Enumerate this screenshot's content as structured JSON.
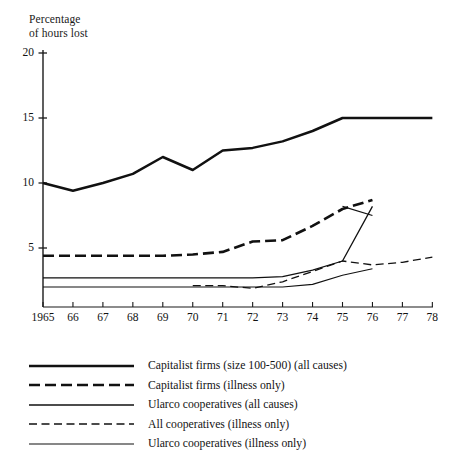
{
  "figure": {
    "axis_title": "Percentage\nof hours lost"
  },
  "axis": {
    "y_ticks": [
      "5",
      "10",
      "15",
      "20"
    ],
    "x_ticks": [
      "1965",
      "66",
      "67",
      "68",
      "69",
      "70",
      "71",
      "72",
      "73",
      "74",
      "75",
      "76",
      "77",
      "78"
    ]
  },
  "legend": {
    "items": [
      {
        "label": "Capitalist firms (size 100-500) (all causes)",
        "style": "solid-thick",
        "name": "legend-capitalist-all-causes"
      },
      {
        "label": "Capitalist firms (illness only)",
        "style": "dashed-thick",
        "name": "legend-capitalist-illness"
      },
      {
        "label": "Ularco cooperatives (all causes)",
        "style": "solid-thin",
        "name": "legend-ularco-all-causes"
      },
      {
        "label": "All cooperatives (illness only)",
        "style": "dashed-thin",
        "name": "legend-all-coops-illness"
      },
      {
        "label": "Ularco cooperatives (illness only)",
        "style": "solid-hairline",
        "name": "legend-ularco-illness"
      }
    ]
  },
  "chart_data": {
    "type": "line",
    "title": "",
    "xlabel": "",
    "ylabel": "Percentage of hours lost",
    "xlim": [
      1965,
      1978
    ],
    "ylim": [
      0,
      21
    ],
    "yticks": [
      5,
      10,
      15,
      20
    ],
    "xticks": [
      1965,
      1966,
      1967,
      1968,
      1969,
      1970,
      1971,
      1972,
      1973,
      1974,
      1975,
      1976,
      1977,
      1978
    ],
    "grid": false,
    "legend_position": "below",
    "series": [
      {
        "name": "Capitalist firms (size 100-500) (all causes)",
        "style": "solid-thick",
        "x": [
          1965,
          1966,
          1967,
          1968,
          1969,
          1970,
          1971,
          1972,
          1973,
          1974,
          1975,
          1976,
          1977,
          1978
        ],
        "values": [
          10.0,
          9.4,
          10.0,
          10.7,
          12.0,
          11.0,
          12.5,
          12.7,
          13.2,
          14.0,
          15.0,
          15.0,
          15.0,
          15.0
        ]
      },
      {
        "name": "Capitalist firms (illness only)",
        "style": "dashed-thick",
        "x": [
          1965,
          1966,
          1967,
          1968,
          1969,
          1970,
          1971,
          1972,
          1973,
          1974,
          1975,
          1976
        ],
        "values": [
          4.4,
          4.4,
          4.4,
          4.4,
          4.4,
          4.5,
          4.7,
          5.5,
          5.6,
          6.7,
          8.0,
          8.7
        ]
      },
      {
        "name": "Ularco cooperatives (all causes)",
        "style": "solid-thin",
        "x": [
          1965,
          1966,
          1967,
          1968,
          1969,
          1970,
          1971,
          1972,
          1973,
          1974,
          1975,
          1976
        ],
        "values": [
          2.7,
          2.7,
          2.7,
          2.7,
          2.7,
          2.7,
          2.7,
          2.7,
          2.8,
          3.3,
          4.0,
          8.2
        ]
      },
      {
        "name": "All cooperatives (illness only)",
        "style": "dashed-thin",
        "x": [
          1970,
          1971,
          1972,
          1973,
          1974,
          1975,
          1976,
          1977,
          1978
        ],
        "values": [
          2.1,
          2.1,
          1.9,
          2.4,
          3.2,
          4.0,
          3.7,
          3.9,
          4.3
        ]
      },
      {
        "name": "Ularco cooperatives (illness only)",
        "style": "solid-hairline",
        "x": [
          1965,
          1966,
          1967,
          1968,
          1969,
          1970,
          1971,
          1972,
          1973,
          1974,
          1975,
          1976
        ],
        "values": [
          2.0,
          2.0,
          2.0,
          2.0,
          2.0,
          2.0,
          2.0,
          2.0,
          2.0,
          2.2,
          2.9,
          3.4
        ]
      }
    ],
    "extra_segment": {
      "name": "Ularco all causes decline 1976",
      "x": [
        1975,
        1976
      ],
      "values": [
        8.2,
        7.5
      ]
    }
  }
}
